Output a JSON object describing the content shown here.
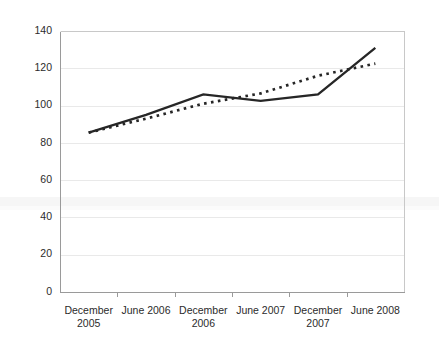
{
  "chart_data": {
    "type": "line",
    "title": "",
    "subtitle": "",
    "xlabel": "",
    "ylabel": "",
    "categories": [
      "December 2005",
      "June 2006",
      "December 2006",
      "June 2007",
      "December 2007",
      "June 2008"
    ],
    "category_lines": [
      [
        "December",
        "2005"
      ],
      [
        "June 2006",
        ""
      ],
      [
        "December",
        "2006"
      ],
      [
        "June 2007",
        ""
      ],
      [
        "December",
        "2007"
      ],
      [
        "June 2008",
        ""
      ]
    ],
    "series": [
      {
        "name": "solid-series",
        "style": "solid",
        "color": "#262626",
        "values": [
          85.5,
          95.0,
          106.0,
          102.5,
          106.0,
          131.0
        ]
      },
      {
        "name": "dotted-series",
        "style": "dotted",
        "color": "#262626",
        "values": [
          85.5,
          93.0,
          101.0,
          106.5,
          116.0,
          122.5
        ]
      }
    ],
    "ylim": [
      0,
      140
    ],
    "ytick_values": [
      0,
      20,
      40,
      60,
      80,
      100,
      120,
      140
    ],
    "ytick_labels": [
      "0",
      "20",
      "40",
      "60",
      "80",
      "100",
      "120",
      "140"
    ],
    "grid": true,
    "grid_axis": "y",
    "legend": false,
    "legend_position": "none",
    "colors": {
      "background": "#ffffff",
      "gridline": "#e9e9e9",
      "axis": "#9a9a9a",
      "frame": "#c8c8c8",
      "series": "#262626",
      "text": "#2b2b2b"
    },
    "plot_area": {
      "left": 60,
      "right": 404,
      "top": 31,
      "bottom": 292
    }
  }
}
